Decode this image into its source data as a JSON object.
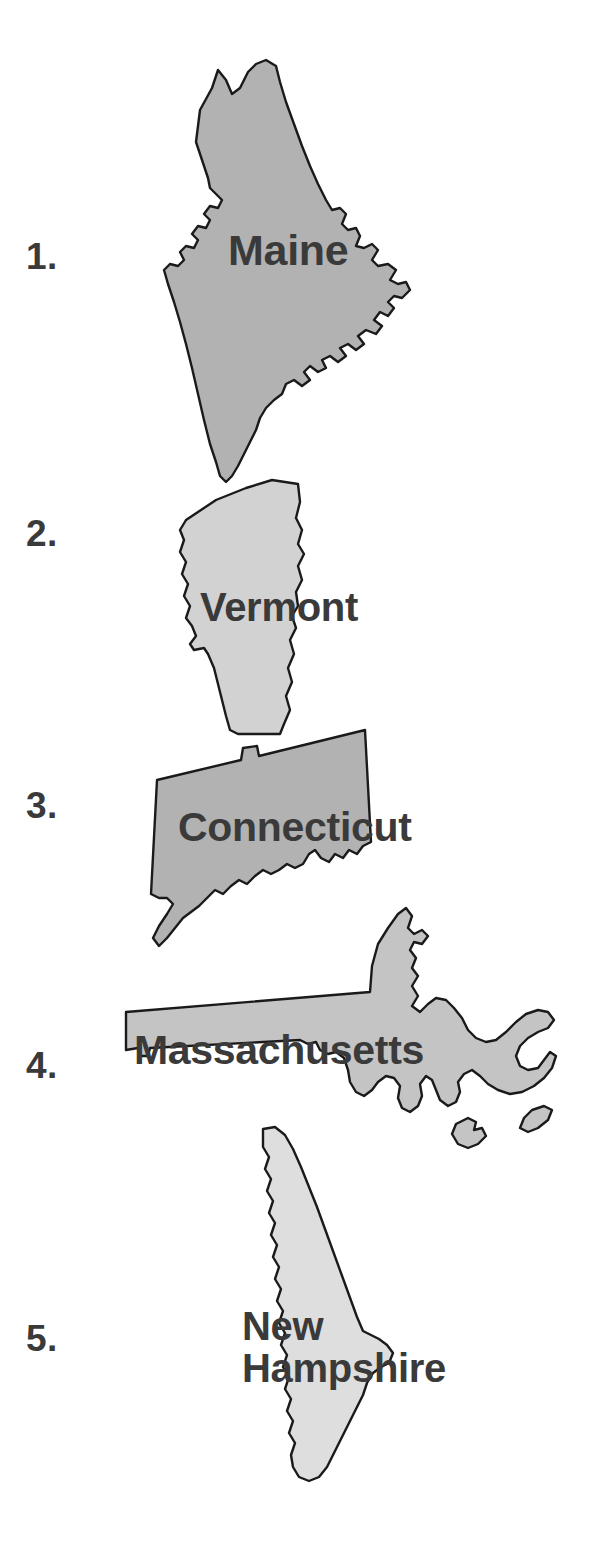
{
  "worksheet": {
    "background_color": "#ffffff",
    "text_color": "#3a3a3a",
    "outline_color": "#1a1a1a",
    "items": [
      {
        "number": "1.",
        "state": "Maine",
        "label_lines": [
          "Maine"
        ],
        "fill_color": "#b2b2b2",
        "shape_name": "maine-map-shape"
      },
      {
        "number": "2.",
        "state": "Vermont",
        "label_lines": [
          "Vermont"
        ],
        "fill_color": "#d2d2d2",
        "shape_name": "vermont-map-shape"
      },
      {
        "number": "3.",
        "state": "Connecticut",
        "label_lines": [
          "Connecticut"
        ],
        "fill_color": "#b2b2b2",
        "shape_name": "connecticut-map-shape"
      },
      {
        "number": "4.",
        "state": "Massachusetts",
        "label_lines": [
          "Massachusetts"
        ],
        "fill_color": "#c4c4c4",
        "shape_name": "massachusetts-map-shape"
      },
      {
        "number": "5.",
        "state": "New Hampshire",
        "label_lines": [
          "New",
          "Hampshire"
        ],
        "fill_color": "#dedede",
        "shape_name": "new-hampshire-map-shape"
      }
    ]
  }
}
